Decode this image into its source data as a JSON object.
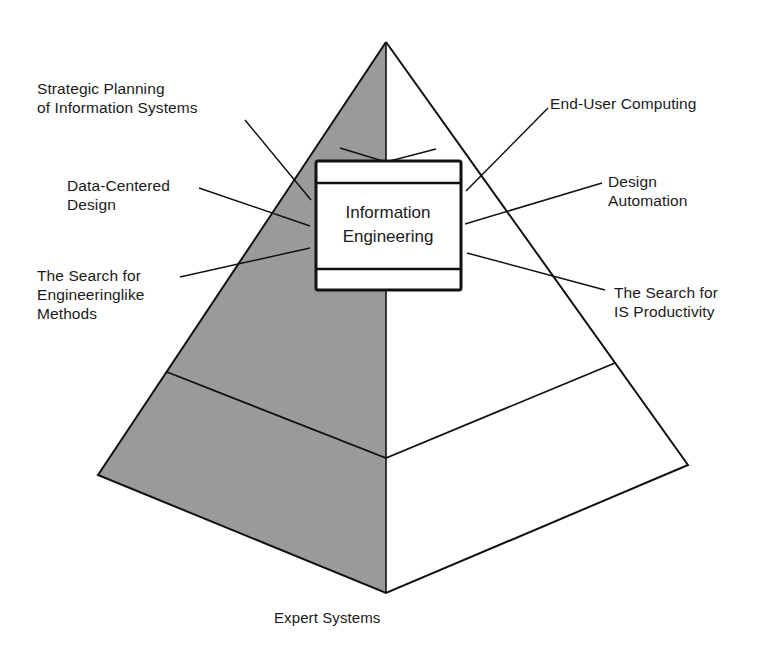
{
  "diagram": {
    "type": "pyramid",
    "colors": {
      "shaded_face": "#9a9a9a",
      "light_face": "#ffffff",
      "stroke": "#111111"
    },
    "center_box": {
      "line1": "Information",
      "line2": "Engineering"
    },
    "labels": {
      "strategic_planning": {
        "line1": "Strategic Planning",
        "line2": "of Information Systems"
      },
      "data_centered": {
        "line1": "Data-Centered",
        "line2": "Design"
      },
      "engineeringlike": {
        "line1": "The Search for",
        "line2": "Engineeringlike",
        "line3": "Methods"
      },
      "end_user": {
        "line1": "End-User Computing"
      },
      "design_automation": {
        "line1": "Design",
        "line2": "Automation"
      },
      "is_productivity": {
        "line1": "The Search for",
        "line2": "IS Productivity"
      },
      "expert_systems": {
        "line1": "Expert Systems"
      }
    }
  }
}
